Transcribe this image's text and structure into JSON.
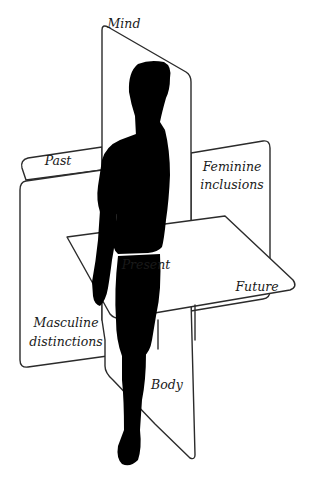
{
  "diagram": {
    "labels": {
      "mind": "Mind",
      "past": "Past",
      "feminine": "Feminine\ninclusions",
      "feminine_line1": "Feminine",
      "feminine_line2": "inclusions",
      "present": "Present",
      "future": "Future",
      "masculine_line1": "Masculine",
      "masculine_line2": "distinctions",
      "body": "Body"
    },
    "planes": [
      {
        "id": "vertical-plane",
        "axis": "Mind / Body"
      },
      {
        "id": "back-plane",
        "axis": "Past / Feminine inclusions / Masculine distinctions"
      },
      {
        "id": "horizontal-plane",
        "axis": "Present / Future"
      }
    ],
    "figure": "walking-person-silhouette",
    "colors": {
      "stroke": "#2b2b2b",
      "fill": "#ffffff",
      "silhouette": "#000000",
      "text": "#1a1a1a"
    }
  }
}
